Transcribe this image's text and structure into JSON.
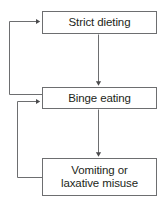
{
  "diagram": {
    "type": "flowchart",
    "title": "",
    "orientation": "vertical",
    "line_color": "#6d6e70",
    "text_color": "#231f20",
    "background_color": "#ffffff",
    "nodes": [
      {
        "id": "strict_dieting",
        "label": "Strict dieting",
        "shape": "rectangle",
        "order": 1
      },
      {
        "id": "binge_eating",
        "label": "Binge eating",
        "shape": "rectangle",
        "order": 2
      },
      {
        "id": "vomiting_laxative",
        "label": "Vomiting or\nlaxative misuse",
        "shape": "rectangle",
        "order": 3
      }
    ],
    "edges": [
      {
        "id": "edge_dieting_to_binge",
        "from": "strict_dieting",
        "to": "binge_eating",
        "label": "",
        "style": "straight-down",
        "arrowhead": true
      },
      {
        "id": "edge_binge_to_vomiting",
        "from": "binge_eating",
        "to": "vomiting_laxative",
        "label": "",
        "style": "straight-down",
        "arrowhead": true
      },
      {
        "id": "edge_binge_to_dieting",
        "from": "binge_eating",
        "to": "strict_dieting",
        "label": "",
        "style": "feedback-loop-left",
        "arrowhead": true
      },
      {
        "id": "edge_vomiting_to_binge",
        "from": "vomiting_laxative",
        "to": "binge_eating",
        "label": "",
        "style": "feedback-loop-left",
        "arrowhead": true
      }
    ]
  }
}
